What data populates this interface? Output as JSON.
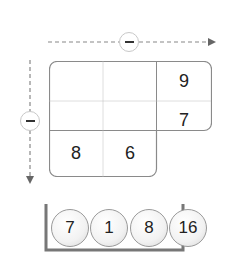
{
  "puzzle": {
    "horizontal_operator": "minus",
    "vertical_operator": "minus",
    "grid": {
      "rows": [
        [
          "",
          "",
          "9"
        ],
        [
          "",
          "",
          "7"
        ],
        [
          "8",
          "6",
          null
        ]
      ]
    },
    "tray": {
      "balls": [
        "7",
        "1",
        "8",
        "16"
      ]
    }
  },
  "colors": {
    "border": "#8a8a8a",
    "dotted": "#c0c0c0",
    "tray": "#777777"
  }
}
